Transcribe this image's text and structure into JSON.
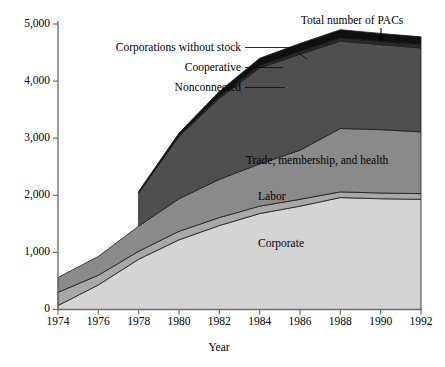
{
  "chart_data": {
    "type": "area",
    "stacked": true,
    "title": "",
    "xlabel": "Year",
    "ylabel": "",
    "x": [
      1974,
      1976,
      1978,
      1980,
      1982,
      1984,
      1986,
      1988,
      1990,
      1992
    ],
    "xlim": [
      1974,
      1992
    ],
    "ylim": [
      0,
      5000
    ],
    "xticks": [
      1974,
      1976,
      1978,
      1980,
      1982,
      1984,
      1986,
      1988,
      1990,
      1992
    ],
    "xtick_labels": [
      "1974",
      "1976",
      "1978",
      "1980",
      "1982",
      "1984",
      "1986",
      "1988",
      "1990",
      "1992"
    ],
    "yticks": [
      0,
      1000,
      2000,
      3000,
      4000,
      5000
    ],
    "ytick_labels": [
      "0",
      "1,000",
      "2,000",
      "3,000",
      "4,000",
      "5,000"
    ],
    "grid": false,
    "legend_position": "in-plot-and-callout",
    "series": [
      {
        "name": "Corporate",
        "label": "Corporate",
        "color": "#d4d4d4",
        "label_kind": "in-plot",
        "values": [
          70,
          430,
          880,
          1220,
          1470,
          1680,
          1810,
          1960,
          1940,
          1930
        ]
      },
      {
        "name": "Labor",
        "label": "Labor",
        "color": "#a8a8a8",
        "label_kind": "in-plot",
        "values": [
          230,
          170,
          140,
          150,
          140,
          130,
          120,
          100,
          100,
          100
        ]
      },
      {
        "name": "Trade, membership, and health",
        "label": "Trade, membership, and health",
        "color": "#8a8a8a",
        "label_kind": "in-plot",
        "values": [
          260,
          330,
          440,
          570,
          670,
          740,
          860,
          1110,
          1110,
          1080
        ]
      },
      {
        "name": "Nonconnected",
        "label": "Nonconnected",
        "color": "#4f4f4f",
        "label_kind": "callout",
        "values": [
          0,
          0,
          580,
          1090,
          1420,
          1680,
          1680,
          1530,
          1490,
          1470
        ]
      },
      {
        "name": "Cooperative",
        "label": "Cooperative",
        "color": "#2a2a2a",
        "label_kind": "callout",
        "values": [
          0,
          0,
          10,
          20,
          30,
          40,
          50,
          55,
          55,
          55
        ]
      },
      {
        "name": "Corporations without stock",
        "label": "Corporations without stock",
        "color": "#101010",
        "label_kind": "callout",
        "values": [
          0,
          0,
          20,
          40,
          90,
          130,
          140,
          145,
          140,
          140
        ]
      }
    ],
    "totals": [
      560,
      930,
      2070,
      3090,
      3820,
      4400,
      4660,
      4900,
      4835,
      4775
    ],
    "annotations": [
      {
        "text": "Total number of PACs",
        "target_year": 1990,
        "kind": "arrow-callout"
      }
    ]
  },
  "labels": {
    "total_pacs": "Total number of PACs",
    "corporations_without_stock": "Corporations without stock",
    "cooperative": "Cooperative",
    "nonconnected": "Nonconnected",
    "trade_membership_health": "Trade, membership, and health",
    "labor": "Labor",
    "corporate": "Corporate",
    "x_axis_title": "Year"
  },
  "y_ticks": [
    {
      "value": "5,000"
    },
    {
      "value": "4,000"
    },
    {
      "value": "3,000"
    },
    {
      "value": "2,000"
    },
    {
      "value": "1,000"
    },
    {
      "value": "0"
    }
  ],
  "x_ticks": [
    {
      "value": "1974"
    },
    {
      "value": "1976"
    },
    {
      "value": "1978"
    },
    {
      "value": "1980"
    },
    {
      "value": "1982"
    },
    {
      "value": "1984"
    },
    {
      "value": "1986"
    },
    {
      "value": "1988"
    },
    {
      "value": "1990"
    },
    {
      "value": "1992"
    }
  ],
  "colors": {
    "corporate": "#d4d4d4",
    "labor": "#a8a8a8",
    "trade": "#8a8a8a",
    "nonconnected": "#4f4f4f",
    "cooperative": "#2a2a2a",
    "corporations_without_stock": "#101010",
    "axis": "#6e6e6e",
    "text": "#000000",
    "background": "#ffffff"
  }
}
